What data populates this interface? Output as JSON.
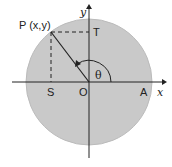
{
  "diagram": {
    "labels": {
      "point_p": "P (x,y)",
      "point_t": "T",
      "point_s": "S",
      "origin": "O",
      "point_a": "A",
      "x_axis": "x",
      "y_axis": "y",
      "angle": "θ"
    },
    "colors": {
      "circle_fill": "#c8c8c8",
      "stroke": "#222222"
    }
  }
}
